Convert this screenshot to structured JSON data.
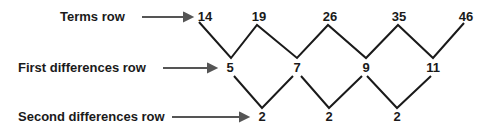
{
  "diagram": {
    "rows": [
      {
        "label": "Terms row",
        "values": [
          "14",
          "19",
          "26",
          "35",
          "46"
        ]
      },
      {
        "label": "First differences row",
        "values": [
          "5",
          "7",
          "9",
          "11"
        ]
      },
      {
        "label": "Second differences row",
        "values": [
          "2",
          "2",
          "2"
        ]
      }
    ],
    "colors": {
      "ink": "#1a1a1a",
      "arrow": "#555555"
    }
  }
}
